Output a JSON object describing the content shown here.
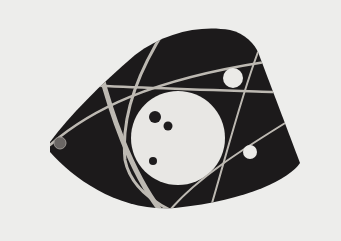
{
  "image": {
    "subject": "Modernist brooch photograph",
    "style": "black-and-white",
    "colors": {
      "background": "#ededeb",
      "plate": "#1c1a1b",
      "inlay_line": "#bdb9b2",
      "disc": "#e8e7e4",
      "dot_dark": "#1e1c1d",
      "stone": "#6a6664"
    }
  }
}
